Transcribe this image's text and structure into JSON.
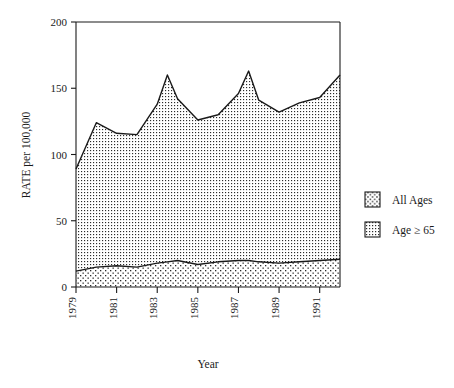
{
  "chart_data": {
    "type": "area",
    "title": "",
    "subtitle": "",
    "xlabel": "Year",
    "ylabel": "RATE per 100,000",
    "xlim": [
      1979,
      1992
    ],
    "ylim": [
      0,
      200
    ],
    "yticks": [
      0,
      50,
      100,
      150,
      200
    ],
    "ytick_labels": [
      "0",
      "50",
      "100",
      "150",
      "200"
    ],
    "xticks": [
      1979,
      1981,
      1983,
      1985,
      1987,
      1989,
      1991
    ],
    "xtick_labels": [
      "1979",
      "1981",
      "1983",
      "1985",
      "1987",
      "1989",
      "1991"
    ],
    "grid": false,
    "legend_position": "right",
    "stacked": false,
    "x": [
      1979,
      1980,
      1981,
      1982,
      1983,
      1983.5,
      1984,
      1985,
      1986,
      1987,
      1987.5,
      1988,
      1989,
      1990,
      1991,
      1992
    ],
    "series": [
      {
        "name": "All Ages",
        "fill": "sparse-dot",
        "values": [
          12,
          15,
          16,
          15,
          18,
          19,
          20,
          17,
          19,
          20,
          20,
          19,
          18,
          19,
          20,
          21
        ]
      },
      {
        "name": "Age ≥ 65",
        "fill": "dense-dot",
        "values": [
          89,
          124,
          116,
          115,
          138,
          160,
          142,
          126,
          130,
          146,
          163,
          141,
          132,
          139,
          143,
          160
        ]
      }
    ],
    "annotations": []
  },
  "legend": {
    "items": [
      {
        "label": "All Ages",
        "swatch": "sparse-dot-swatch"
      },
      {
        "label": "Age ≥ 65",
        "swatch": "dense-dot-swatch"
      }
    ]
  },
  "axes": {
    "y_title": "RATE per 100,000",
    "x_title": "Year"
  },
  "colors": {
    "ink": "#1a1a1a",
    "background": "#ffffff",
    "pattern_dot": "#2b2b2b"
  }
}
